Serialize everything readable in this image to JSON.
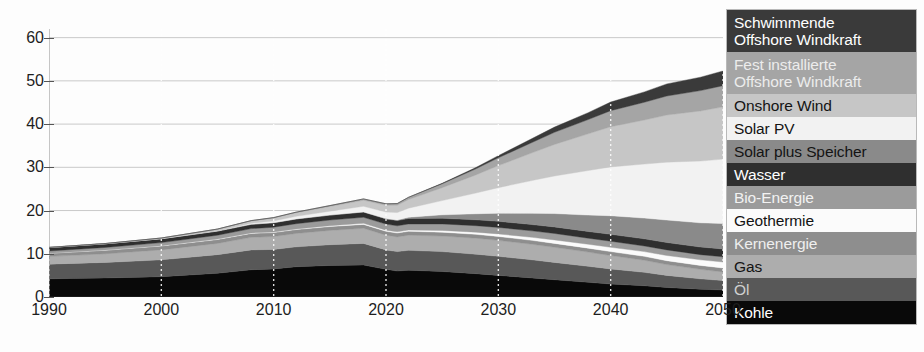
{
  "chart_data": {
    "type": "area",
    "stacked": true,
    "title": "",
    "subtitle": "",
    "xlabel": "",
    "ylabel": "",
    "xlim": [
      1990,
      2050
    ],
    "ylim": [
      0,
      62
    ],
    "xticks": [
      1990,
      2000,
      2010,
      2020,
      2030,
      2040,
      2050
    ],
    "yticks": [
      0,
      10,
      20,
      30,
      40,
      50,
      60
    ],
    "xtick_labels": [
      "1990",
      "2000",
      "2010",
      "2020",
      "2030",
      "2040",
      "2050"
    ],
    "ytick_labels": [
      "0",
      "10",
      "20",
      "30",
      "40",
      "50",
      "60"
    ],
    "grid": "dotted-vertical-and-solid-horizontal",
    "legend_position": "right-inside",
    "x": [
      1990,
      1995,
      2000,
      2005,
      2008,
      2010,
      2012,
      2015,
      2018,
      2020,
      2021,
      2022,
      2025,
      2028,
      2030,
      2033,
      2035,
      2038,
      2040,
      2043,
      2045,
      2048,
      2050
    ],
    "series": [
      {
        "name": "Kohle",
        "color": "#090909",
        "text_color": "#ffffff",
        "values": [
          4.2,
          4.4,
          4.7,
          5.5,
          6.3,
          6.5,
          7.0,
          7.3,
          7.4,
          6.4,
          6.0,
          6.2,
          5.9,
          5.4,
          5.0,
          4.4,
          4.0,
          3.4,
          3.0,
          2.6,
          2.2,
          1.8,
          1.6
        ]
      },
      {
        "name": "Öl",
        "color": "#585858",
        "text_color": "#e8e8e8",
        "values": [
          3.4,
          3.6,
          3.9,
          4.3,
          4.6,
          4.5,
          4.6,
          4.8,
          5.0,
          4.5,
          4.5,
          4.6,
          4.6,
          4.5,
          4.4,
          4.2,
          4.0,
          3.7,
          3.5,
          3.1,
          2.8,
          2.4,
          2.2
        ]
      },
      {
        "name": "Gas",
        "color": "#adadad",
        "text_color": "#1a1a1a",
        "values": [
          1.8,
          2.0,
          2.3,
          2.6,
          2.9,
          3.0,
          3.1,
          3.3,
          3.5,
          3.4,
          3.4,
          3.5,
          3.6,
          3.7,
          3.7,
          3.6,
          3.5,
          3.3,
          3.1,
          2.8,
          2.5,
          2.2,
          2.0
        ]
      },
      {
        "name": "Kernenergie",
        "color": "#8e8e8e",
        "text_color": "#efefef",
        "values": [
          0.7,
          0.8,
          0.9,
          0.9,
          0.9,
          0.9,
          0.9,
          0.9,
          0.9,
          0.9,
          0.9,
          0.9,
          0.9,
          0.9,
          0.9,
          0.9,
          0.9,
          0.9,
          0.9,
          0.9,
          0.9,
          0.9,
          0.9
        ]
      },
      {
        "name": "Geothermie",
        "color": "#fbfbfb",
        "text_color": "#141414",
        "values": [
          0.05,
          0.06,
          0.08,
          0.1,
          0.12,
          0.14,
          0.16,
          0.2,
          0.24,
          0.26,
          0.27,
          0.3,
          0.4,
          0.5,
          0.6,
          0.7,
          0.8,
          0.9,
          1.0,
          1.1,
          1.2,
          1.3,
          1.4
        ]
      },
      {
        "name": "Bio-Energie",
        "color": "#9b9b9b",
        "text_color": "#f2f2f2",
        "values": [
          0.5,
          0.6,
          0.7,
          0.9,
          1.0,
          1.1,
          1.2,
          1.3,
          1.4,
          1.4,
          1.4,
          1.4,
          1.5,
          1.5,
          1.5,
          1.5,
          1.5,
          1.4,
          1.4,
          1.3,
          1.3,
          1.2,
          1.2
        ]
      },
      {
        "name": "Wasser",
        "color": "#2f2f2f",
        "text_color": "#ffffff",
        "values": [
          0.8,
          0.85,
          0.9,
          0.95,
          1.0,
          1.05,
          1.1,
          1.15,
          1.2,
          1.2,
          1.2,
          1.25,
          1.3,
          1.35,
          1.4,
          1.45,
          1.5,
          1.55,
          1.6,
          1.65,
          1.7,
          1.75,
          1.8
        ]
      },
      {
        "name": "Solar plus Speicher",
        "color": "#8a8a8a",
        "text_color": "#141414",
        "values": [
          0.0,
          0.0,
          0.0,
          0.0,
          0.0,
          0.0,
          0.0,
          0.0,
          0.05,
          0.1,
          0.15,
          0.3,
          0.8,
          1.4,
          1.9,
          2.6,
          3.1,
          3.8,
          4.3,
          4.8,
          5.2,
          5.6,
          5.9
        ]
      },
      {
        "name": "Solar PV",
        "color": "#f2f2f2",
        "text_color": "#141414",
        "values": [
          0.0,
          0.0,
          0.02,
          0.1,
          0.25,
          0.4,
          0.6,
          0.9,
          1.3,
          1.5,
          1.7,
          2.1,
          3.3,
          4.8,
          5.9,
          7.6,
          8.7,
          10.3,
          11.3,
          12.5,
          13.4,
          14.3,
          14.9
        ]
      },
      {
        "name": "Onshore Wind",
        "color": "#c6c6c6",
        "text_color": "#141414",
        "values": [
          0.02,
          0.06,
          0.15,
          0.35,
          0.55,
          0.7,
          0.85,
          1.1,
          1.4,
          1.55,
          1.7,
          2.0,
          3.0,
          4.2,
          5.1,
          6.4,
          7.3,
          8.5,
          9.3,
          10.2,
          10.9,
          11.6,
          12.1
        ]
      },
      {
        "name": "Fest installierte Offshore Windkraft",
        "color": "#a5a5a5",
        "text_color": "#ececec",
        "values": [
          0.0,
          0.0,
          0.0,
          0.02,
          0.05,
          0.08,
          0.12,
          0.2,
          0.3,
          0.35,
          0.4,
          0.5,
          0.9,
          1.4,
          1.8,
          2.4,
          2.8,
          3.3,
          3.7,
          4.1,
          4.4,
          4.7,
          4.9
        ]
      },
      {
        "name": "Schwimmende Offshore Windkraft",
        "color": "#3a3a3a",
        "text_color": "#ffffff",
        "values": [
          0.0,
          0.0,
          0.0,
          0.0,
          0.0,
          0.0,
          0.0,
          0.0,
          0.0,
          0.0,
          0.0,
          0.02,
          0.1,
          0.3,
          0.5,
          0.9,
          1.2,
          1.6,
          2.0,
          2.4,
          2.8,
          3.1,
          3.4
        ]
      }
    ],
    "totals": [
      11.47,
      12.37,
      13.65,
      15.72,
      17.67,
      18.37,
      19.63,
      21.18,
      22.69,
      21.56,
      21.62,
      23.07,
      26.2,
      29.95,
      32.7,
      36.55,
      39.3,
      43.65,
      47.1,
      50.45,
      53.3,
      55.85,
      58.3
    ],
    "annotations": []
  },
  "legend": {
    "items": [
      {
        "label": "Schwimmende\nOffshore Windkraft",
        "color": "#3a3a3a",
        "text_color": "#ffffff",
        "lines": 2
      },
      {
        "label": "Fest installierte\nOffshore Windkraft",
        "color": "#a5a5a5",
        "text_color": "#ececec",
        "lines": 2
      },
      {
        "label": "Onshore Wind",
        "color": "#c6c6c6",
        "text_color": "#141414",
        "lines": 1
      },
      {
        "label": "Solar PV",
        "color": "#f2f2f2",
        "text_color": "#141414",
        "lines": 1
      },
      {
        "label": "Solar plus Speicher",
        "color": "#8a8a8a",
        "text_color": "#141414",
        "lines": 1
      },
      {
        "label": "Wasser",
        "color": "#2f2f2f",
        "text_color": "#ffffff",
        "lines": 1
      },
      {
        "label": "Bio-Energie",
        "color": "#9b9b9b",
        "text_color": "#f2f2f2",
        "lines": 1
      },
      {
        "label": "Geothermie",
        "color": "#fbfbfb",
        "text_color": "#141414",
        "lines": 1
      },
      {
        "label": "Kernenergie",
        "color": "#8e8e8e",
        "text_color": "#efefef",
        "lines": 1
      },
      {
        "label": "Gas",
        "color": "#adadad",
        "text_color": "#141414",
        "lines": 1
      },
      {
        "label": "Öl",
        "color": "#585858",
        "text_color": "#d0d0d0",
        "lines": 1
      },
      {
        "label": "Kohle",
        "color": "#090909",
        "text_color": "#ffffff",
        "lines": 1
      }
    ]
  },
  "style": {
    "grid_h_color": "#c9c9c9",
    "grid_v_color": "#bdbdbd",
    "axis_color": "#444444",
    "background": "#fdfdfd"
  }
}
